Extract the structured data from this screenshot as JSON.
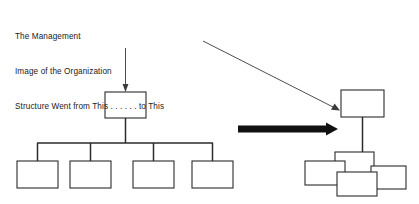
{
  "diagram": {
    "title_lines": [
      "The Management",
      "Image of the Organization",
      "Structure Went from This . . . . . . to This"
    ],
    "caption_full": "The Management Image of the Organization Structure Went from This . . . . . . to This",
    "colors": {
      "background": "#ffffff",
      "box_stroke": "#2b2b2b",
      "box_fill": "#ffffff",
      "connector": "#2b2b2b",
      "thin_arrow": "#3a3a3a",
      "bold_arrow": "#111111",
      "text": "#1a1a1a"
    },
    "left_chart": {
      "name": "traditional-hierarchy",
      "top_box": {
        "x": 105,
        "y": 92,
        "w": 41,
        "h": 26
      },
      "stem": {
        "x": 125.5,
        "y1": 118,
        "y2": 143
      },
      "crossbar": {
        "y": 143,
        "x1": 37,
        "x2": 213
      },
      "child_boxes": [
        {
          "x": 17,
          "y": 161,
          "w": 41,
          "h": 27
        },
        {
          "x": 70,
          "y": 161,
          "w": 41,
          "h": 27
        },
        {
          "x": 133,
          "y": 161,
          "w": 41,
          "h": 27
        },
        {
          "x": 192,
          "y": 161,
          "w": 41,
          "h": 27
        }
      ],
      "child_drops": [
        {
          "x": 37.5,
          "y1": 143,
          "y2": 161
        },
        {
          "x": 90.5,
          "y1": 143,
          "y2": 161
        },
        {
          "x": 153.5,
          "y1": 143,
          "y2": 161
        },
        {
          "x": 212.5,
          "y1": 143,
          "y2": 161
        }
      ]
    },
    "right_chart": {
      "name": "jumbled-hierarchy",
      "top_box": {
        "x": 341,
        "y": 90,
        "w": 43,
        "h": 27
      },
      "stem": {
        "x": 362.5,
        "y1": 117,
        "y2": 154
      },
      "overlapping_boxes": [
        {
          "x": 335,
          "y": 152,
          "w": 39,
          "h": 25
        },
        {
          "x": 305,
          "y": 161,
          "w": 40,
          "h": 24
        },
        {
          "x": 371,
          "y": 166,
          "w": 35,
          "h": 23
        },
        {
          "x": 337,
          "y": 172,
          "w": 40,
          "h": 24
        }
      ]
    },
    "arrows": {
      "vertical_arrow": {
        "name": "arrow-to-traditional-chart",
        "x": 125.5,
        "y1": 48,
        "y2": 91
      },
      "diagonal_arrow": {
        "name": "arrow-to-jumbled-chart",
        "x1": 203,
        "y1": 41,
        "x2": 339,
        "y2": 110
      },
      "bold_arrow": {
        "name": "transformation-arrow",
        "x1": 238,
        "x2": 338,
        "y": 129,
        "thickness": 7
      }
    }
  }
}
